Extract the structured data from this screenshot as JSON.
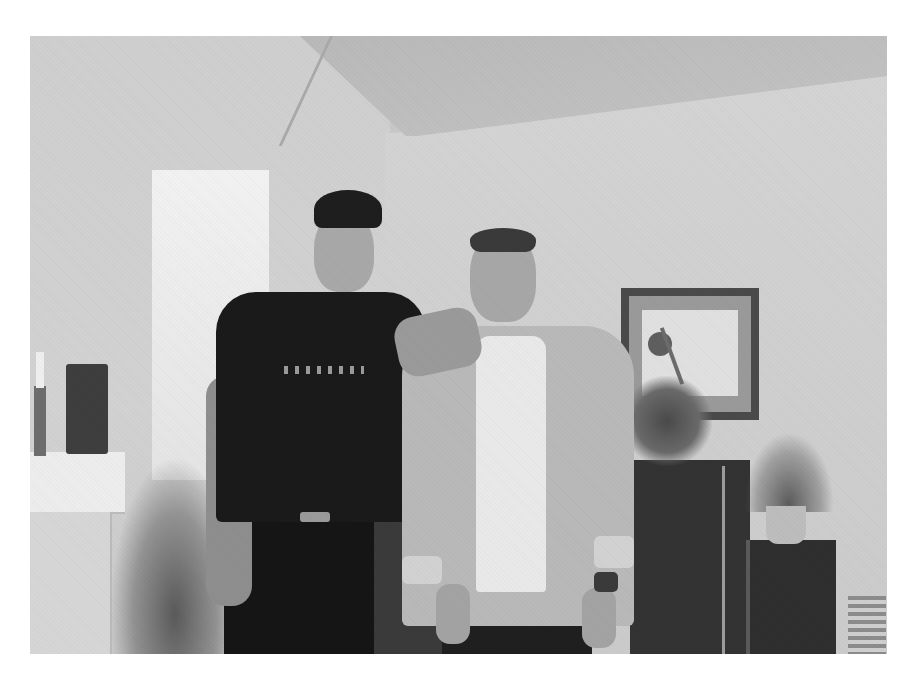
{
  "image": {
    "type": "photograph",
    "color_mode": "black-and-white",
    "description": "Two men posing side by side in a living room; the man on the left wears a dark cap and black t-shirt and rests his arm on the shoulder of the man on the right, who wears an open light button-up shirt over a white t-shirt and a wristwatch. Background includes a window, mantel with candle and small speaker, grassy potted plant, framed botanical artwork, leafy plant, dark cabinet, speaker with potted plant, and a stack of items in the corner.",
    "subjects": [
      {
        "position": "left",
        "clothing": "dark baseball cap, black t-shirt with light lettering, dark pants with belt"
      },
      {
        "position": "right",
        "clothing": "open light-colored button-up shirt with rolled sleeves, white t-shirt, dark pants, wristwatch"
      }
    ],
    "objects": [
      "window",
      "mantel",
      "candle in candlestick",
      "small speaker",
      "grass-like plant",
      "framed botanical print",
      "leafy plant",
      "dark cabinet",
      "floor speaker",
      "potted plant",
      "stacked items"
    ],
    "colors": {
      "page_bg": "#ffffff",
      "wall": "#d0d0d0",
      "dark_clothing": "#1a1a1a",
      "frame": "#4a4a4a"
    }
  }
}
